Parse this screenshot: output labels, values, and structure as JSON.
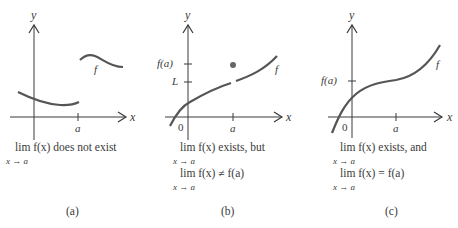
{
  "figure": {
    "panels": [
      {
        "id": "a",
        "panel_label": "(a)",
        "y_axis_label": "y",
        "x_axis_label": "x",
        "x_tick_label": "a",
        "curve_label": "f",
        "caption_line1": "lim f(x) does not exist",
        "caption_line1_sub": "x → a"
      },
      {
        "id": "b",
        "panel_label": "(b)",
        "y_axis_label": "y",
        "x_axis_label": "x",
        "x_tick_label": "a",
        "origin_label": "0",
        "y_tick_labels": [
          "f(a)",
          "L"
        ],
        "curve_label": "f",
        "caption_line1": "lim f(x) exists, but",
        "caption_line1_sub": "x → a",
        "caption_line2": "lim f(x) ≠ f(a)",
        "caption_line2_sub": "x → a"
      },
      {
        "id": "c",
        "panel_label": "(c)",
        "y_axis_label": "y",
        "x_axis_label": "x",
        "x_tick_label": "a",
        "origin_label": "0",
        "y_tick_labels": [
          "f(a)"
        ],
        "curve_label": "f",
        "caption_line1": "lim f(x) exists, and",
        "caption_line1_sub": "x → a",
        "caption_line2": "lim f(x) = f(a)",
        "caption_line2_sub": "x → a"
      }
    ],
    "colors": {
      "ink": "#3a3a3a",
      "curve": "#555555",
      "background": "#ffffff"
    }
  }
}
